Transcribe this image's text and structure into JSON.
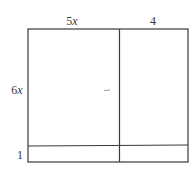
{
  "diagram": {
    "type": "area-model-rectangle",
    "top_labels": {
      "left": {
        "coef": "5",
        "var": "x"
      },
      "right": {
        "coef": "4",
        "var": ""
      }
    },
    "side_labels": {
      "top": {
        "coef": "6",
        "var": "x"
      },
      "bottom": {
        "coef": "1",
        "var": ""
      }
    },
    "rows": [
      "6x",
      "1"
    ],
    "columns": [
      "5x",
      "4"
    ],
    "regions": [
      {
        "row": "6x",
        "col": "5x",
        "text": ""
      },
      {
        "row": "6x",
        "col": "4",
        "text": ""
      },
      {
        "row": "1",
        "col": "5x",
        "text": ""
      },
      {
        "row": "1",
        "col": "4",
        "text": ""
      }
    ],
    "colors": {
      "line": "#3a3a3a",
      "text": "#3a3a3a",
      "background": "#ffffff"
    }
  }
}
